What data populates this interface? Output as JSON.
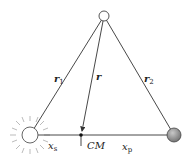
{
  "diagram": {
    "labels": {
      "r1": "r",
      "r1_sub": "1",
      "r": "r",
      "r2": "r",
      "r2_sub": "2",
      "xs": "x",
      "xs_sub": "s",
      "cm": "CM",
      "xp": "x",
      "xp_sub": "p"
    },
    "nodes": {
      "test_mass": {
        "x": 104,
        "y": 16,
        "r": 5
      },
      "star": {
        "x": 30,
        "y": 135,
        "r": 8
      },
      "planet": {
        "x": 174,
        "y": 135,
        "r": 7
      },
      "center_of_mass": {
        "x": 81,
        "y": 135
      }
    },
    "colors": {
      "line": "#333333",
      "planet_fill": "#8a8a8a",
      "star_rays": "#999999"
    }
  }
}
